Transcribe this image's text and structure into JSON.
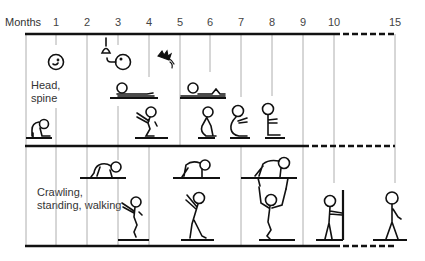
{
  "axis": {
    "label": "Months",
    "months": [
      {
        "label": "1",
        "x": 56
      },
      {
        "label": "2",
        "x": 87
      },
      {
        "label": "3",
        "x": 118
      },
      {
        "label": "4",
        "x": 149
      },
      {
        "label": "5",
        "x": 180
      },
      {
        "label": "6",
        "x": 210
      },
      {
        "label": "7",
        "x": 241
      },
      {
        "label": "8",
        "x": 272
      },
      {
        "label": "9",
        "x": 303
      },
      {
        "label": "10",
        "x": 334
      },
      {
        "label": "15",
        "x": 395
      }
    ]
  },
  "sections": {
    "head_spine": {
      "label_line1": "Head,",
      "label_line2": "spine"
    },
    "locomotion": {
      "label_line1": "Crawling,",
      "label_line2": "standing, walking"
    }
  },
  "colors": {
    "line": "#111111",
    "grid": "#999999",
    "text": "#333333"
  }
}
